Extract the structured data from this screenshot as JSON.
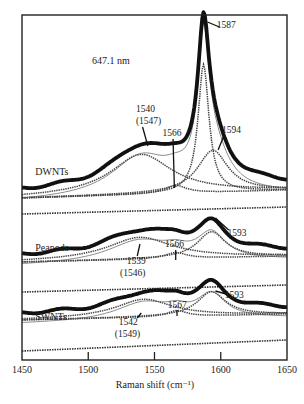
{
  "chart_data": {
    "type": "line",
    "title": "",
    "annotation": "647.1 nm",
    "xlabel": "Raman shift (cm⁻¹)",
    "ylabel": "",
    "xlim": [
      1450,
      1650
    ],
    "xticks": [
      1450,
      1500,
      1550,
      1600,
      1650
    ],
    "grid": false,
    "legend": "none",
    "series": [
      {
        "name": "DWNTs",
        "baseline_px": [
          198,
          190
        ],
        "offset_px": 200,
        "total": {
          "broad_center": 1540,
          "components": [
            {
              "center": 1540,
              "width": 28,
              "amp": 40
            },
            {
              "center": 1566,
              "width": 10,
              "amp": 8
            },
            {
              "center": 1587,
              "width": 5,
              "amp": 128
            },
            {
              "center": 1594,
              "width": 14,
              "amp": 42
            }
          ]
        },
        "labels": [
          {
            "text": "1587",
            "x": 1597,
            "y": 28,
            "lx1": 1590,
            "ly1": 22,
            "lx2": 1599,
            "ly2": 27
          },
          {
            "text": "1540",
            "x": 1536,
            "y": 112
          },
          {
            "text": "(1547)",
            "x": 1536,
            "y": 124,
            "lx1": 1541,
            "ly1": 127,
            "lx2": 1545,
            "ly2": 146
          },
          {
            "text": "1566",
            "x": 1556,
            "y": 136,
            "lx1": 1564,
            "ly1": 139,
            "lx2": 1565,
            "ly2": 188
          },
          {
            "text": "1594",
            "x": 1601,
            "y": 133,
            "lx1": 1602,
            "ly1": 137,
            "lx2": 1598,
            "ly2": 150
          }
        ],
        "sample_label": {
          "text": "DWNTs",
          "x": 1460,
          "y": 175
        }
      },
      {
        "name": "Peapods",
        "baseline_px": [
          262,
          256
        ],
        "offset_px": 262,
        "total": {
          "components": [
            {
              "center": 1539,
              "width": 30,
              "amp": 22
            },
            {
              "center": 1566,
              "width": 10,
              "amp": 6
            },
            {
              "center": 1593,
              "width": 13,
              "amp": 26
            }
          ]
        },
        "labels": [
          {
            "text": "1593",
            "x": 1605,
            "y": 236,
            "lx1": 1596,
            "ly1": 218,
            "lx2": 1606,
            "ly2": 230
          },
          {
            "text": "1566",
            "x": 1558,
            "y": 247,
            "lx1": 1566,
            "ly1": 250,
            "lx2": 1566,
            "ly2": 260
          },
          {
            "text": "1539",
            "x": 1529,
            "y": 264,
            "lx1": 1537,
            "ly1": 256,
            "lx2": 1539,
            "ly2": 244
          },
          {
            "text": "(1546)",
            "x": 1524,
            "y": 276
          }
        ],
        "sample_label": {
          "text": "Peapods",
          "x": 1460,
          "y": 251
        }
      },
      {
        "name": "SWNTs",
        "baseline_px": [
          320,
          314
        ],
        "offset_px": 320,
        "total": {
          "components": [
            {
              "center": 1542,
              "width": 26,
              "amp": 18
            },
            {
              "center": 1567,
              "width": 9,
              "amp": 6
            },
            {
              "center": 1593,
              "width": 13,
              "amp": 24
            }
          ]
        },
        "labels": [
          {
            "text": "1593",
            "x": 1603,
            "y": 298,
            "lx1": 1596,
            "ly1": 291,
            "lx2": 1604,
            "ly2": 294
          },
          {
            "text": "1567",
            "x": 1560,
            "y": 308,
            "lx1": 1567,
            "ly1": 310,
            "lx2": 1567,
            "ly2": 316
          },
          {
            "text": "1542",
            "x": 1523,
            "y": 325,
            "lx1": 1537,
            "ly1": 318,
            "lx2": 1540,
            "ly2": 313
          },
          {
            "text": "(1549)",
            "x": 1520,
            "y": 337
          }
        ],
        "sample_label": {
          "text": "SWNTs",
          "x": 1460,
          "y": 320
        }
      }
    ],
    "separator_baselines_px": [
      {
        "y_left": 214,
        "y_right": 207
      },
      {
        "y_left": 292,
        "y_right": 285
      },
      {
        "y_left": 351,
        "y_right": 340
      }
    ]
  },
  "axes": {
    "frame": {
      "x0": 22,
      "x1": 287,
      "y0": 15,
      "y1": 360
    },
    "tick_label_y": 373,
    "xlabel_y": 388
  }
}
